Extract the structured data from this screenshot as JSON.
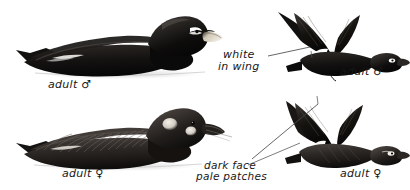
{
  "plate": {
    "title": "White-winged Scoter plate",
    "background_color": "#ffffff",
    "ink_color": "#171717",
    "width": 410,
    "height": 190
  },
  "labels": {
    "swimming_male": "adult ♂",
    "swimming_female": "adult ♀",
    "flying_male": "adult ♂",
    "flying_female": "adult ♀",
    "white_in_wing_line1": "white",
    "white_in_wing_line2": "in wing",
    "dark_face_line1": "dark face",
    "dark_face_line2": "pale patches"
  },
  "figures": [
    {
      "name": "swimming-adult-male",
      "pose": "swimming",
      "sex": "male",
      "features": [
        "all dark body",
        "white comma eye patch",
        "pale orange bill with dark knob"
      ],
      "label": "adult ♂"
    },
    {
      "name": "swimming-adult-female",
      "pose": "swimming",
      "sex": "female",
      "features": [
        "dark brown body",
        "two pale face patches",
        "dark bill"
      ],
      "label": "adult ♀"
    },
    {
      "name": "flying-adult-male",
      "pose": "flying",
      "sex": "male",
      "features": [
        "white speculum in wing",
        "white eye patch",
        "dark body"
      ],
      "label": "adult ♂"
    },
    {
      "name": "flying-adult-female",
      "pose": "flying",
      "sex": "female",
      "features": [
        "white speculum in wing",
        "pale face patch",
        "dark brown body"
      ],
      "label": "adult ♀"
    }
  ],
  "leader_lines": [
    {
      "name": "white-in-wing-leader",
      "from": "white in wing label",
      "to": "flying male wing patch"
    },
    {
      "name": "dark-face-leader-upper",
      "from": "dark face pale patches label",
      "to": "flying male wing patch"
    },
    {
      "name": "dark-face-leader-lower",
      "from": "dark face pale patches label",
      "to": "flying female wing patch"
    }
  ],
  "colors": {
    "ink": "#171717",
    "body_dark": "#0d0d0d",
    "body_mid": "#2a2724",
    "body_soft": "#3b3633",
    "bill_pale": "#efe9dd",
    "patch_pale": "#e8e4dc",
    "water": "#d9d9d9",
    "background": "#ffffff"
  }
}
